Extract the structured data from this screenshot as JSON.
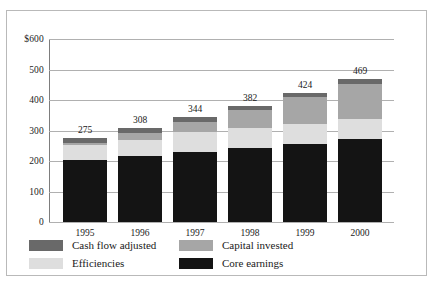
{
  "chart_data": {
    "type": "bar",
    "stacked": true,
    "title": "",
    "subtitle": "",
    "xlabel": "",
    "ylabel": "",
    "currency_prefix": "$",
    "categories": [
      "1995",
      "1996",
      "1997",
      "1998",
      "1999",
      "2000"
    ],
    "series": [
      {
        "name": "Core earnings",
        "color": "#141414",
        "values": [
          203,
          216,
          230,
          243,
          255,
          272
        ]
      },
      {
        "name": "Efficiencies",
        "color": "#dedede",
        "values": [
          48,
          52,
          64,
          66,
          66,
          66
        ]
      },
      {
        "name": "Capital invested",
        "color": "#a6a6a6",
        "values": [
          7,
          24,
          33,
          58,
          89,
          113
        ]
      },
      {
        "name": "Cash flow adjusted",
        "color": "#696969",
        "values": [
          17,
          16,
          17,
          15,
          14,
          18
        ]
      }
    ],
    "totals": [
      275,
      308,
      344,
      382,
      424,
      469
    ],
    "data_labels": [
      "275",
      "308",
      "344",
      "382",
      "424",
      "469"
    ],
    "ylim": [
      0,
      600
    ],
    "yticks": [
      0,
      100,
      200,
      300,
      400,
      500,
      600
    ],
    "ytick_labels": [
      "0",
      "100",
      "200",
      "300",
      "400",
      "500",
      "$600"
    ],
    "grid": true,
    "legend_position": "bottom",
    "legend": [
      {
        "label": "Cash flow adjusted",
        "color": "#696969",
        "swatch": "cash"
      },
      {
        "label": "Capital invested",
        "color": "#a6a6a6",
        "swatch": "cap"
      },
      {
        "label": "Efficiencies",
        "color": "#dedede",
        "swatch": "eff"
      },
      {
        "label": "Core earnings",
        "color": "#141414",
        "swatch": "core"
      }
    ]
  },
  "yticks": {
    "t0": "0",
    "t1": "100",
    "t2": "200",
    "t3": "300",
    "t4": "400",
    "t5": "500",
    "t6": "$600"
  },
  "xticks": {
    "c0": "1995",
    "c1": "1996",
    "c2": "1997",
    "c3": "1998",
    "c4": "1999",
    "c5": "2000"
  },
  "totals": {
    "c0": "275",
    "c1": "308",
    "c2": "344",
    "c3": "382",
    "c4": "424",
    "c5": "469"
  },
  "legend": {
    "cash_flow_adjusted": "Cash flow adjusted",
    "capital_invested": "Capital invested",
    "efficiencies": "Efficiencies",
    "core_earnings": "Core earnings"
  }
}
